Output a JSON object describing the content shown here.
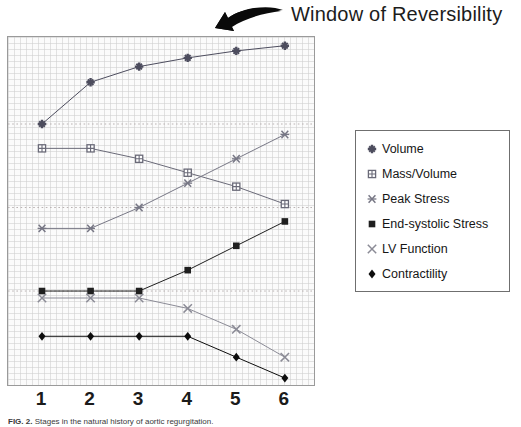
{
  "title": {
    "text": "Window of Reversibility",
    "arrow_icon": "curved-arrow-icon"
  },
  "caption": {
    "label": "FIG. 2.",
    "text": "Stages in the natural history of aortic regurgitation."
  },
  "axis": {
    "x_ticks": [
      "1",
      "2",
      "3",
      "4",
      "5",
      "6"
    ]
  },
  "legend": {
    "position": "right",
    "items": [
      {
        "label": "Volume",
        "marker": "plus-star-marker",
        "color": "#4d4d5e"
      },
      {
        "label": "Mass/Volume",
        "marker": "open-square-marker",
        "color": "#6a6a78"
      },
      {
        "label": "Peak Stress",
        "marker": "asterisk-marker",
        "color": "#777785"
      },
      {
        "label": "End-systolic Stress",
        "marker": "filled-square-marker",
        "color": "#1f1f1f"
      },
      {
        "label": "LV Function",
        "marker": "x-cross-marker",
        "color": "#8b8b96"
      },
      {
        "label": "Contractility",
        "marker": "filled-diamond-marker",
        "color": "#0d0d0d"
      }
    ]
  },
  "chart_data": {
    "type": "line",
    "title": "Window of Reversibility",
    "xlabel": "",
    "ylabel": "",
    "x": [
      1,
      2,
      3,
      4,
      5,
      6
    ],
    "xlim": [
      0.3,
      6.6
    ],
    "ylim": [
      0,
      100
    ],
    "grid": true,
    "gridlines_y": [
      75,
      51,
      27
    ],
    "legend_position": "right",
    "series": [
      {
        "name": "Volume",
        "marker": "plus-star-marker",
        "color": "#4d4d5e",
        "values": [
          75,
          87,
          91.5,
          94,
          96,
          97.5
        ]
      },
      {
        "name": "Mass/Volume",
        "marker": "open-square-marker",
        "color": "#6a6a78",
        "values": [
          68,
          68,
          65,
          61,
          57,
          52
        ]
      },
      {
        "name": "Peak Stress",
        "marker": "asterisk-marker",
        "color": "#777785",
        "values": [
          45,
          45,
          51,
          58,
          65,
          72
        ]
      },
      {
        "name": "End-systolic Stress",
        "marker": "filled-square-marker",
        "color": "#1f1f1f",
        "values": [
          27,
          27,
          27,
          33,
          40,
          47
        ]
      },
      {
        "name": "LV Function",
        "marker": "x-cross-marker",
        "color": "#8b8b96",
        "values": [
          25,
          25,
          25,
          22,
          16,
          8
        ]
      },
      {
        "name": "Contractility",
        "marker": "filled-diamond-marker",
        "color": "#0d0d0d",
        "values": [
          14,
          14,
          14,
          14,
          8,
          2
        ]
      }
    ]
  }
}
